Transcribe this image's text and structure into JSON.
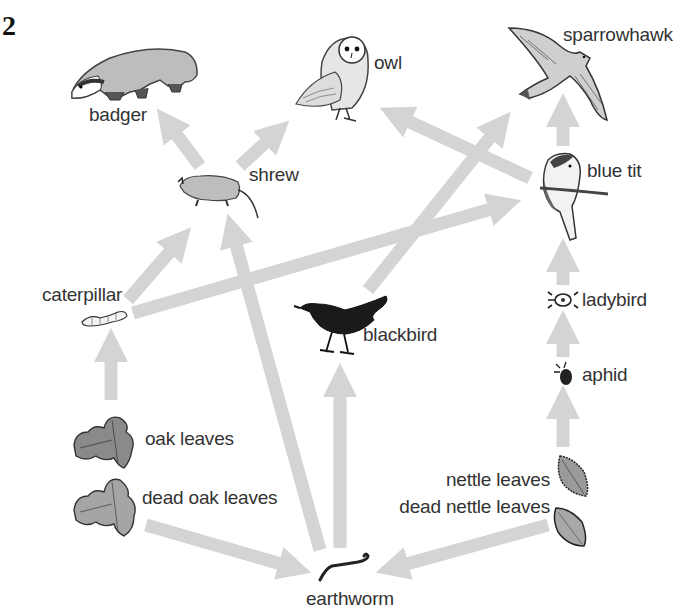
{
  "question_number": "2",
  "colors": {
    "arrow": "#d4d4d4",
    "text": "#333333",
    "background": "#ffffff"
  },
  "organisms": [
    {
      "id": "badger",
      "label": "badger",
      "icon": "badger-icon"
    },
    {
      "id": "owl",
      "label": "owl",
      "icon": "owl-icon"
    },
    {
      "id": "sparrowhawk",
      "label": "sparrowhawk",
      "icon": "sparrowhawk-icon"
    },
    {
      "id": "shrew",
      "label": "shrew",
      "icon": "shrew-icon"
    },
    {
      "id": "blue_tit",
      "label": "blue tit",
      "icon": "blue-tit-icon"
    },
    {
      "id": "caterpillar",
      "label": "caterpillar",
      "icon": "caterpillar-icon"
    },
    {
      "id": "blackbird",
      "label": "blackbird",
      "icon": "blackbird-icon"
    },
    {
      "id": "ladybird",
      "label": "ladybird",
      "icon": "ladybird-icon"
    },
    {
      "id": "aphid",
      "label": "aphid",
      "icon": "aphid-icon"
    },
    {
      "id": "oak_leaves",
      "label": "oak leaves",
      "icon": "oak-leaf-icon"
    },
    {
      "id": "dead_oak_leaves",
      "label": "dead oak leaves",
      "icon": "dead-oak-leaf-icon"
    },
    {
      "id": "nettle_leaves",
      "label": "nettle leaves",
      "icon": "nettle-leaf-icon"
    },
    {
      "id": "dead_nettle_leaves",
      "label": "dead nettle leaves",
      "icon": "dead-nettle-leaf-icon"
    },
    {
      "id": "earthworm",
      "label": "earthworm",
      "icon": "earthworm-icon"
    }
  ],
  "feeding_links": [
    {
      "from": "oak leaves",
      "to": "caterpillar"
    },
    {
      "from": "caterpillar",
      "to": "shrew"
    },
    {
      "from": "caterpillar",
      "to": "blue tit"
    },
    {
      "from": "shrew",
      "to": "badger"
    },
    {
      "from": "shrew",
      "to": "owl"
    },
    {
      "from": "earthworm",
      "to": "shrew"
    },
    {
      "from": "earthworm",
      "to": "blackbird"
    },
    {
      "from": "blackbird",
      "to": "sparrowhawk"
    },
    {
      "from": "blue tit",
      "to": "owl"
    },
    {
      "from": "blue tit",
      "to": "sparrowhawk"
    },
    {
      "from": "ladybird",
      "to": "blue tit"
    },
    {
      "from": "aphid",
      "to": "ladybird"
    },
    {
      "from": "nettle leaves",
      "to": "aphid"
    },
    {
      "from": "dead oak leaves",
      "to": "earthworm"
    },
    {
      "from": "dead nettle leaves",
      "to": "earthworm"
    }
  ]
}
